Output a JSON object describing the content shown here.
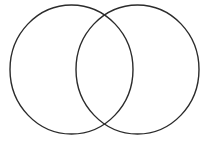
{
  "canvas": {
    "width": 209,
    "height": 141,
    "background_color": "#ffffff"
  },
  "diagram": {
    "type": "venn",
    "set_count": 2,
    "stroke_color": "#2b2b2b",
    "stroke_width": 1.4,
    "fill_color": "none",
    "title": "",
    "labels_present": false,
    "shapes": [
      {
        "name": "left-set",
        "shape": "ellipse",
        "cx": 71.5,
        "cy": 69.5,
        "rx": 61.5,
        "ry": 64.5,
        "label": "",
        "fill": "none",
        "stroke": "#2b2b2b"
      },
      {
        "name": "right-set",
        "shape": "ellipse",
        "cx": 137.5,
        "cy": 69.5,
        "rx": 61.5,
        "ry": 64.5,
        "label": "",
        "fill": "none",
        "stroke": "#2b2b2b"
      }
    ],
    "regions": [
      {
        "name": "left-only",
        "label": ""
      },
      {
        "name": "intersection",
        "label": ""
      },
      {
        "name": "right-only",
        "label": ""
      }
    ],
    "intersection_points": [
      {
        "name": "top-crossing",
        "x": 104.5,
        "y": 10
      },
      {
        "name": "bottom-crossing",
        "x": 104.5,
        "y": 129
      }
    ]
  }
}
